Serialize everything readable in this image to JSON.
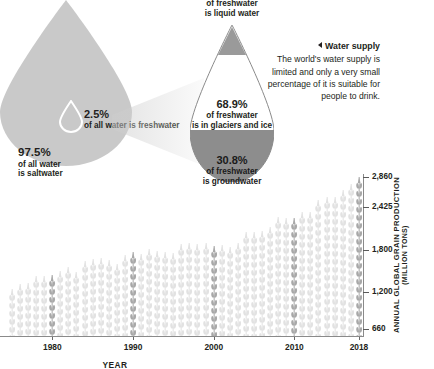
{
  "droplets": {
    "liquid": {
      "line1": "of freshwater",
      "line2": "is liquid water"
    },
    "freshwater": {
      "pct": "2.5%",
      "line1": "of all water is freshwater"
    },
    "saltwater": {
      "pct": "97.5%",
      "line1": "of all water",
      "line2": "is saltwater"
    },
    "glaciers": {
      "pct": "68.9%",
      "line1": "of freshwater",
      "line2": "is in glaciers and ice"
    },
    "groundwater": {
      "pct": "30.8%",
      "line1": "of freshwater",
      "line2": "is groundwater"
    }
  },
  "note": {
    "heading": "Water supply",
    "body": "The world's water supply is limited and only a very small percentage of it is suitable for people to drink."
  },
  "colors": {
    "big_drop_fill": "#c9c9c9",
    "glacier_fill": "#ffffff",
    "groundwater_fill": "#8d8d8d",
    "drop_tip_fill": "#9a9a9a",
    "bar_light": "#e2e2e2",
    "bar_dark": "#a8a8a8",
    "text": "#231f20"
  },
  "chart_data": {
    "type": "bar",
    "title": "",
    "xlabel": "YEAR",
    "ylabel": "ANNUAL GLOBAL GRAIN PRODUCTION",
    "yunit": "(MILLION TONS)",
    "ytick_labels": [
      "2,860",
      "2,425",
      "1,800",
      "1,200",
      "660"
    ],
    "ytick_values": [
      2860,
      2425,
      1800,
      1200,
      660
    ],
    "xtick_labels": [
      "1980",
      "1990",
      "2000",
      "2010",
      "2018"
    ],
    "xtick_values": [
      1980,
      1990,
      2000,
      2010,
      2018
    ],
    "ylim": [
      560,
      2900
    ],
    "grid": false,
    "legend": null,
    "x": [
      1975,
      1976,
      1977,
      1978,
      1979,
      1980,
      1981,
      1982,
      1983,
      1984,
      1985,
      1986,
      1987,
      1988,
      1989,
      1990,
      1991,
      1992,
      1993,
      1994,
      1995,
      1996,
      1997,
      1998,
      1999,
      2000,
      2001,
      2002,
      2003,
      2004,
      2005,
      2006,
      2007,
      2008,
      2009,
      2010,
      2011,
      2012,
      2013,
      2014,
      2015,
      2016,
      2017,
      2018
    ],
    "values": [
      1240,
      1310,
      1330,
      1430,
      1420,
      1440,
      1500,
      1550,
      1490,
      1640,
      1670,
      1690,
      1660,
      1600,
      1730,
      1780,
      1750,
      1820,
      1790,
      1770,
      1760,
      1890,
      1900,
      1890,
      1900,
      1860,
      1880,
      1840,
      1900,
      2060,
      2060,
      2070,
      2140,
      2280,
      2270,
      2270,
      2350,
      2350,
      2530,
      2570,
      2570,
      2670,
      2760,
      2860
    ],
    "highlight_years": [
      1980,
      1990,
      2000,
      2010,
      2018
    ]
  }
}
